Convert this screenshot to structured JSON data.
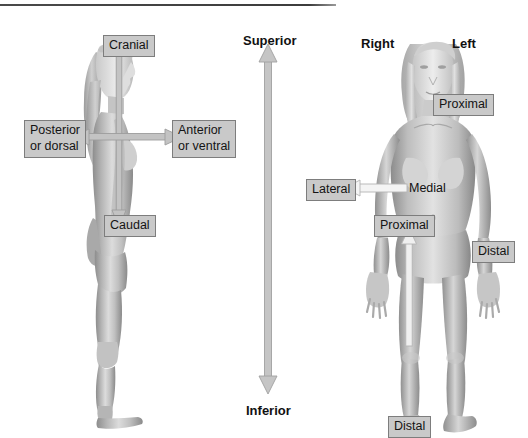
{
  "figure": {
    "background_color": "#ffffff",
    "rule_color": "#3c3c3c"
  },
  "labels": {
    "cranial": "Cranial",
    "caudal": "Caudal",
    "posterior_line1": "Posterior",
    "posterior_line2": "or dorsal",
    "anterior_line1": "Anterior",
    "anterior_line2": "or ventral",
    "superior": "Superior",
    "inferior": "Inferior",
    "right": "Right",
    "left": "Left",
    "proximal_arm": "Proximal",
    "proximal_leg": "Proximal",
    "distal_arm": "Distal",
    "distal_leg": "Distal",
    "lateral": "Lateral",
    "medial": "Medial"
  },
  "colors": {
    "label_fill": "#c9c9c9",
    "label_border": "#7d7d7d",
    "label_text": "#141414",
    "gray_arrow": "#c5c5c5",
    "gray_arrow_stroke": "#9a9a9a",
    "white_arrow": "#f2f2f2",
    "white_arrow_stroke": "#b0b0b0",
    "skin_light": "#e3e3e3",
    "skin_mid": "#b8b8b8",
    "skin_dark": "#8f8f8f"
  },
  "arrows": {
    "superior_inferior": {
      "name": "vertical-double-arrow",
      "direction": "both",
      "orientation": "vertical",
      "top_label": "Superior",
      "bottom_label": "Inferior"
    },
    "cranial_caudal": {
      "name": "cranial-caudal-arrow",
      "direction": "down",
      "orientation": "vertical"
    },
    "posterior_anterior": {
      "name": "posterior-anterior-double-arrow",
      "direction": "both",
      "orientation": "horizontal"
    },
    "medial_lateral": {
      "name": "medial-to-lateral-arrow",
      "direction": "left",
      "orientation": "horizontal"
    },
    "distal_proximal_leg": {
      "name": "distal-to-proximal-arrow",
      "direction": "up",
      "orientation": "vertical"
    }
  }
}
